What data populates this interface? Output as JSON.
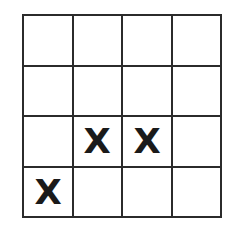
{
  "figure": {
    "name": "grid-puzzle",
    "background_color": "#ffffff",
    "line_color": "#2b2b2b",
    "mark_color": "#1a1a1a",
    "rows": 4,
    "columns": 4,
    "mark_symbol": "X"
  },
  "grid": {
    "cells": [
      [
        {
          "id": "r1c1",
          "value": ""
        },
        {
          "id": "r1c2",
          "value": ""
        },
        {
          "id": "r1c3",
          "value": ""
        },
        {
          "id": "r1c4",
          "value": ""
        }
      ],
      [
        {
          "id": "r2c1",
          "value": ""
        },
        {
          "id": "r2c2",
          "value": ""
        },
        {
          "id": "r2c3",
          "value": ""
        },
        {
          "id": "r2c4",
          "value": ""
        }
      ],
      [
        {
          "id": "r3c1",
          "value": ""
        },
        {
          "id": "r3c2",
          "value": "X"
        },
        {
          "id": "r3c3",
          "value": "X"
        },
        {
          "id": "r3c4",
          "value": ""
        }
      ],
      [
        {
          "id": "r4c1",
          "value": "X"
        },
        {
          "id": "r4c2",
          "value": ""
        },
        {
          "id": "r4c3",
          "value": ""
        },
        {
          "id": "r4c4",
          "value": ""
        }
      ]
    ]
  }
}
